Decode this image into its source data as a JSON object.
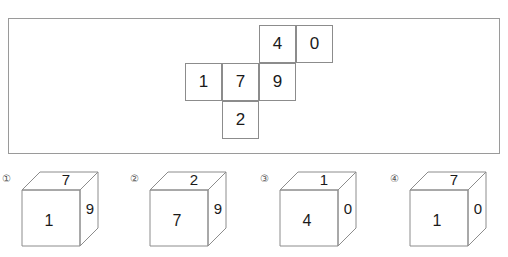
{
  "puzzle": {
    "net": {
      "caption": "",
      "cells": [
        {
          "value": "4",
          "col": 2,
          "row": 0
        },
        {
          "value": "0",
          "col": 3,
          "row": 0
        },
        {
          "value": "1",
          "col": 0,
          "row": 1
        },
        {
          "value": "7",
          "col": 1,
          "row": 1
        },
        {
          "value": "9",
          "col": 2,
          "row": 1
        },
        {
          "value": "2",
          "col": 1,
          "row": 2
        }
      ]
    },
    "options": [
      {
        "label": "①",
        "number": "1",
        "front": "1",
        "top": "7",
        "right": "9"
      },
      {
        "label": "②",
        "number": "2",
        "front": "7",
        "top": "2",
        "right": "9"
      },
      {
        "label": "③",
        "number": "3",
        "front": "4",
        "top": "1",
        "right": "0"
      },
      {
        "label": "④",
        "number": "4",
        "front": "1",
        "top": "7",
        "right": "0"
      }
    ]
  },
  "colors": {
    "line": "#8c8c8c",
    "panel_border": "#9a9a9a",
    "text": "#1a1a1a",
    "label": "#555555",
    "background": "#ffffff"
  }
}
